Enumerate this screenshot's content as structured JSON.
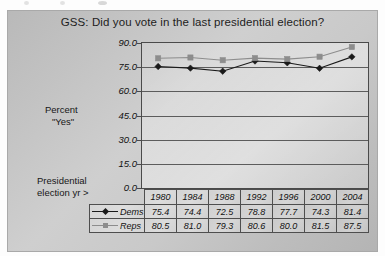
{
  "chart_data": {
    "type": "line",
    "title": "GSS:  Did you vote in the last presidential election?",
    "xlabel": "Presidential election yr >",
    "ylabel": "Percent \"Yes\"",
    "categories": [
      "1980",
      "1984",
      "1988",
      "1992",
      "1996",
      "2000",
      "2004"
    ],
    "series": [
      {
        "name": "Dems",
        "marker": "diamond",
        "color": "#1a1a1a",
        "values": [
          75.4,
          74.4,
          72.5,
          78.8,
          77.7,
          74.3,
          81.4
        ]
      },
      {
        "name": "Reps",
        "marker": "square",
        "color": "#8d8d8d",
        "values": [
          80.5,
          81.0,
          79.3,
          80.6,
          80.0,
          81.5,
          87.5
        ]
      }
    ],
    "ylim": [
      0.0,
      90.0
    ],
    "yticks": [
      "0.0",
      "15.0",
      "30.0",
      "45.0",
      "60.0",
      "75.0",
      "90.0"
    ],
    "ytick_values": [
      0.0,
      15.0,
      30.0,
      45.0,
      60.0,
      75.0,
      90.0
    ],
    "grid": "horizontal",
    "legend_position": "row-header-table",
    "table_shown": true
  },
  "captions": {
    "percent_line1": "Percent",
    "percent_line2": "\"Yes\"",
    "presidential_line1": "Presidential",
    "presidential_line2": "election yr >"
  },
  "colors": {
    "dems": "#1a1a1a",
    "reps": "#8d8d8d",
    "axis": "#4a4a4a",
    "grid": "#5c5c5c",
    "background": "#c4c4c4"
  }
}
